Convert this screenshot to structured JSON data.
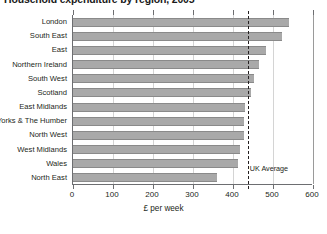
{
  "chart_data": {
    "type": "bar",
    "orientation": "horizontal",
    "title": "Household expenditure by region, 2005",
    "xlabel": "£ per week",
    "ylabel": "",
    "xlim": [
      0,
      600
    ],
    "xticks": [
      0,
      100,
      200,
      300,
      400,
      500,
      600
    ],
    "xtick_labels": [
      "0",
      "100",
      "200",
      "300",
      "400",
      "500",
      "600"
    ],
    "grid": "vertical",
    "legend": "none",
    "categories": [
      "London",
      "South East",
      "East",
      "Northern Ireland",
      "South West",
      "Scotland",
      "East Midlands",
      "Yorks & The Humber",
      "North West",
      "West Midlands",
      "Wales",
      "North East"
    ],
    "values": [
      540,
      522,
      483,
      465,
      452,
      445,
      431,
      428,
      427,
      418,
      412,
      359
    ],
    "bar_color": "#a9a9a9",
    "annotations": [
      {
        "name": "uk-average",
        "label": "UK Average",
        "value": 437,
        "style": "dashed-vertical-line"
      }
    ]
  }
}
